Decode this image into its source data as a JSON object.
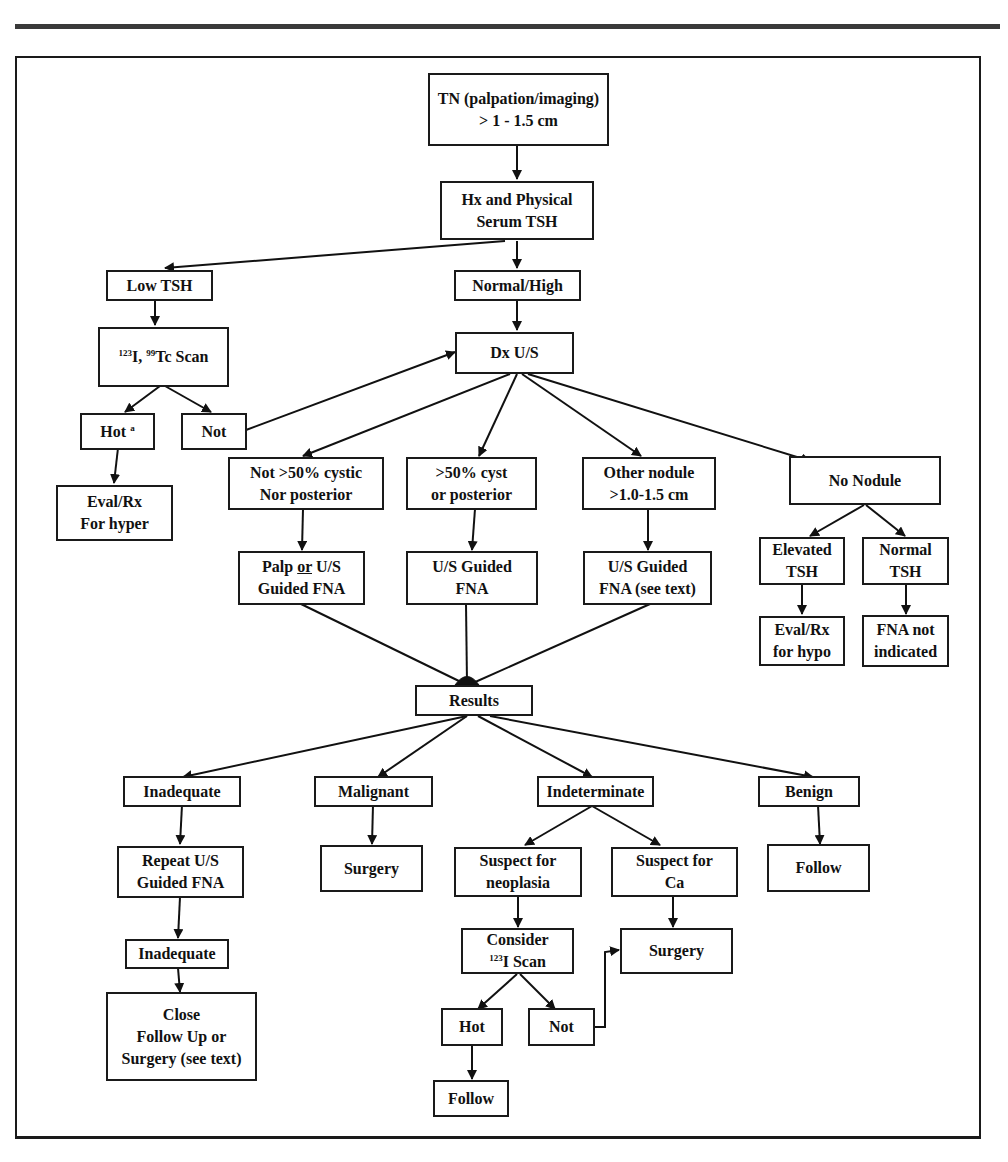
{
  "diagram": {
    "type": "flowchart",
    "nodes": {
      "tn": {
        "label": "TN (palpation/imaging)\n> 1 - 1.5 cm"
      },
      "hx": {
        "label": "Hx and Physical\nSerum TSH"
      },
      "low_tsh": {
        "label": "Low TSH"
      },
      "normal_high": {
        "label": "Normal/High"
      },
      "scan": {
        "sup1": "123",
        "text1": "I, ",
        "sup2": "99",
        "text2": "Tc Scan"
      },
      "hot_a": {
        "text": "Hot ",
        "sup": "a"
      },
      "not_a": {
        "label": "Not"
      },
      "eval_hyper": {
        "label": "Eval/Rx\nFor hyper"
      },
      "dx_us": {
        "label": "Dx U/S"
      },
      "not_cystic": {
        "label": "Not >50% cystic\nNor posterior"
      },
      "cyst_post": {
        "label": ">50% cyst\nor posterior"
      },
      "other_nodule": {
        "label": "Other nodule\n>1.0-1.5 cm"
      },
      "no_nodule": {
        "label": "No Nodule"
      },
      "palp_fna": {
        "pre": "Palp ",
        "u": "or",
        "post": " U/S\nGuided FNA"
      },
      "us_fna": {
        "label": "U/S Guided\nFNA"
      },
      "us_fna_text": {
        "label": "U/S Guided\nFNA (see text)"
      },
      "elevated_tsh": {
        "label": "Elevated\nTSH"
      },
      "normal_tsh": {
        "label": "Normal\nTSH"
      },
      "eval_hypo": {
        "label": "Eval/Rx\nfor hypo"
      },
      "fna_not": {
        "label": "FNA not\nindicated"
      },
      "results": {
        "label": "Results"
      },
      "inadequate": {
        "label": "Inadequate"
      },
      "malignant": {
        "label": "Malignant"
      },
      "indeterminate": {
        "label": "Indeterminate"
      },
      "benign": {
        "label": "Benign"
      },
      "repeat_fna": {
        "label": "Repeat U/S\nGuided  FNA"
      },
      "surgery_1": {
        "label": "Surgery"
      },
      "suspect_neo": {
        "label": "Suspect for\nneoplasia"
      },
      "suspect_ca": {
        "label": "Suspect for\nCa"
      },
      "follow_1": {
        "label": "Follow"
      },
      "inadequate_2": {
        "label": "Inadequate"
      },
      "consider_scan": {
        "line1": "Consider",
        "sup": "123",
        "line2": "I Scan"
      },
      "surgery_2": {
        "label": "Surgery"
      },
      "close_follow": {
        "label": "Close\nFollow Up or\nSurgery (see text)"
      },
      "hot_2": {
        "label": "Hot"
      },
      "not_2": {
        "label": "Not"
      },
      "follow_2": {
        "label": "Follow"
      }
    },
    "edges": [
      [
        "tn",
        "hx"
      ],
      [
        "hx",
        "low_tsh"
      ],
      [
        "hx",
        "normal_high"
      ],
      [
        "low_tsh",
        "scan"
      ],
      [
        "scan",
        "hot_a"
      ],
      [
        "scan",
        "not_a"
      ],
      [
        "hot_a",
        "eval_hyper"
      ],
      [
        "not_a",
        "dx_us"
      ],
      [
        "normal_high",
        "dx_us"
      ],
      [
        "dx_us",
        "not_cystic"
      ],
      [
        "dx_us",
        "cyst_post"
      ],
      [
        "dx_us",
        "other_nodule"
      ],
      [
        "dx_us",
        "no_nodule"
      ],
      [
        "not_cystic",
        "palp_fna"
      ],
      [
        "cyst_post",
        "us_fna"
      ],
      [
        "other_nodule",
        "us_fna_text"
      ],
      [
        "no_nodule",
        "elevated_tsh"
      ],
      [
        "no_nodule",
        "normal_tsh"
      ],
      [
        "elevated_tsh",
        "eval_hypo"
      ],
      [
        "normal_tsh",
        "fna_not"
      ],
      [
        "palp_fna",
        "results"
      ],
      [
        "us_fna",
        "results"
      ],
      [
        "us_fna_text",
        "results"
      ],
      [
        "results",
        "inadequate"
      ],
      [
        "results",
        "malignant"
      ],
      [
        "results",
        "indeterminate"
      ],
      [
        "results",
        "benign"
      ],
      [
        "inadequate",
        "repeat_fna"
      ],
      [
        "malignant",
        "surgery_1"
      ],
      [
        "indeterminate",
        "suspect_neo"
      ],
      [
        "indeterminate",
        "suspect_ca"
      ],
      [
        "benign",
        "follow_1"
      ],
      [
        "repeat_fna",
        "inadequate_2"
      ],
      [
        "inadequate_2",
        "close_follow"
      ],
      [
        "suspect_neo",
        "consider_scan"
      ],
      [
        "suspect_ca",
        "surgery_2"
      ],
      [
        "consider_scan",
        "hot_2"
      ],
      [
        "consider_scan",
        "not_2"
      ],
      [
        "not_2",
        "surgery_2"
      ],
      [
        "hot_2",
        "follow_2"
      ]
    ]
  }
}
